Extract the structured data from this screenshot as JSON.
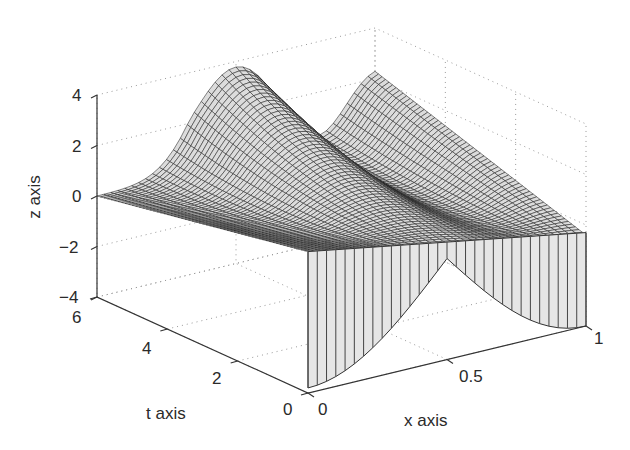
{
  "chart_data": {
    "type": "surface3d",
    "title": "",
    "xlabel": "x axis",
    "ylabel": "t axis",
    "zlabel": "z axis",
    "xlim": [
      0,
      1
    ],
    "tlim": [
      0,
      6
    ],
    "zlim": [
      -4,
      4
    ],
    "x_ticks": [
      "0",
      "0.5",
      "1"
    ],
    "t_ticks": [
      "0",
      "2",
      "4",
      "6"
    ],
    "z_ticks": [
      "4",
      "2",
      "0",
      "−2",
      "−4"
    ],
    "grid": true,
    "grid_style": "dotted",
    "surface": {
      "description": "Wireframe mesh surface z(x,t) with two ridges rising toward x=1 and the far end; front face (t=0) drawn as a shaded curtain with vertical lines",
      "mesh_color": "#1a1a1a",
      "face_color": "#e6e6e6",
      "ridge_peaks": [
        {
          "x": 0.55,
          "t": 6,
          "z": 4.0
        },
        {
          "x": 1.0,
          "t": 6,
          "z": 2.5
        }
      ],
      "front_face_t0": {
        "x": [
          0,
          0.25,
          0.5,
          0.75,
          1.0
        ],
        "top_z": [
          1.6,
          1.2,
          0.6,
          0.2,
          -0.3
        ],
        "bottom_z": [
          -3.8,
          -2.5,
          0.6,
          -2.0,
          -4.0
        ]
      }
    }
  },
  "labels": {
    "z_axis": "z axis",
    "t_axis": "t axis",
    "x_axis": "x axis"
  },
  "ticks": {
    "z": [
      "4",
      "2",
      "0",
      "−2",
      "−4"
    ],
    "t": [
      "6",
      "4",
      "2",
      "0"
    ],
    "x": [
      "0",
      "0.5",
      "1"
    ]
  }
}
